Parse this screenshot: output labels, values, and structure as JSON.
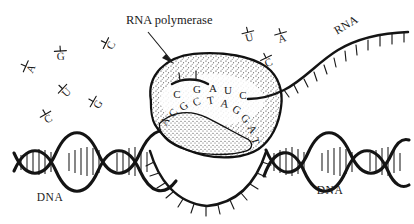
{
  "figure": {
    "title_label": "RNA polymerase",
    "background_color": "#ffffff",
    "ink_color": "#1a1a1a"
  },
  "labels": {
    "polymerase": "RNA polymerase",
    "dna_left": "DNA",
    "dna_right": "DNA",
    "rna": "RNA"
  },
  "rna_transcript": {
    "bases": [
      "C",
      "G",
      "A",
      "U",
      "C"
    ],
    "base_positions": [
      {
        "base": "C",
        "x": 177,
        "y": 98
      },
      {
        "base": "G",
        "x": 197,
        "y": 93
      },
      {
        "base": "A",
        "x": 213,
        "y": 92
      },
      {
        "base": "U",
        "x": 228,
        "y": 94
      },
      {
        "base": "C",
        "x": 243,
        "y": 99
      }
    ]
  },
  "dna_template": {
    "bases": [
      "A",
      "C",
      "G",
      "C",
      "T",
      "A",
      "G",
      "G",
      "A",
      "T"
    ],
    "base_positions": [
      {
        "base": "A",
        "x": 168,
        "y": 123,
        "rot": -62
      },
      {
        "base": "C",
        "x": 176,
        "y": 115,
        "rot": -52
      },
      {
        "base": "G",
        "x": 186,
        "y": 109,
        "rot": -38
      },
      {
        "base": "C",
        "x": 198,
        "y": 105,
        "rot": -22
      },
      {
        "base": "T",
        "x": 211,
        "y": 104,
        "rot": -8
      },
      {
        "base": "A",
        "x": 224,
        "y": 107,
        "rot": 12
      },
      {
        "base": "G",
        "x": 235,
        "y": 113,
        "rot": 30
      },
      {
        "base": "G",
        "x": 243,
        "y": 121,
        "rot": 48
      },
      {
        "base": "A",
        "x": 249,
        "y": 131,
        "rot": 62
      },
      {
        "base": "T",
        "x": 252,
        "y": 142,
        "rot": 74
      }
    ]
  },
  "free_nucleotides": [
    {
      "letter": "A",
      "x": 34,
      "y": 70,
      "rot": -66
    },
    {
      "letter": "G",
      "x": 61,
      "y": 60,
      "rot": -4
    },
    {
      "letter": "C",
      "x": 114,
      "y": 47,
      "rot": -64
    },
    {
      "letter": "U",
      "x": 69,
      "y": 95,
      "rot": -46
    },
    {
      "letter": "G",
      "x": 101,
      "y": 106,
      "rot": -60
    },
    {
      "letter": "C",
      "x": 50,
      "y": 122,
      "rot": -30
    },
    {
      "letter": "U",
      "x": 250,
      "y": 41,
      "rot": -14
    },
    {
      "letter": "A",
      "x": 283,
      "y": 42,
      "rot": -16
    },
    {
      "letter": "C",
      "x": 270,
      "y": 66,
      "rot": -26
    }
  ]
}
